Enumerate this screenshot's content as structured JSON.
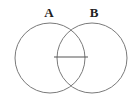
{
  "diagram": {
    "type": "venn",
    "sets": [
      {
        "label": "A",
        "cx": 50,
        "cy": 58,
        "r": 35
      },
      {
        "label": "B",
        "cx": 92,
        "cy": 58,
        "r": 35
      }
    ],
    "intersection_line": {
      "x1": 54,
      "y1": 57,
      "x2": 88,
      "y2": 57
    },
    "stroke_color": "#7a7a7a"
  }
}
